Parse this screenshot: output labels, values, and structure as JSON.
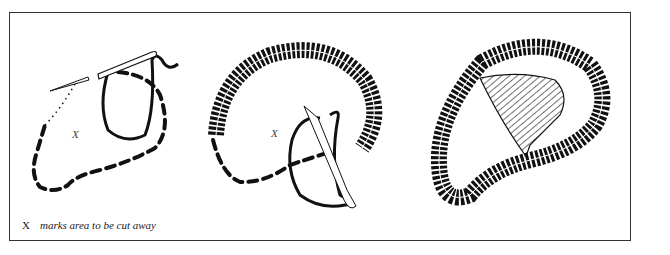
{
  "figure": {
    "panels": [
      {
        "id": "step-1",
        "description": "Running stitch outline with needle and looped thread",
        "area_label": "X"
      },
      {
        "id": "step-2",
        "description": "Buttonhole stitch worked around outline with needle",
        "area_label": "X"
      },
      {
        "id": "step-3",
        "description": "Completed buttonhole edge with center area hatched (cut away)"
      }
    ],
    "caption": {
      "symbol": "X",
      "text": "marks area to be cut away"
    },
    "colors": {
      "ink": "#111111",
      "frame": "#333333",
      "background": "#ffffff"
    }
  }
}
